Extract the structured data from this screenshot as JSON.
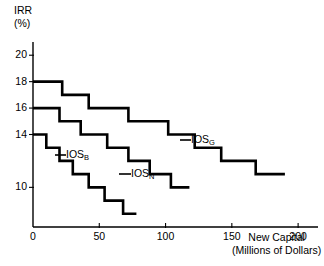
{
  "chart_data": {
    "type": "line",
    "title": "",
    "subtitle": "",
    "xlabel_line1": "New Capital",
    "xlabel_line2": "(Millions of Dollars)",
    "ylabel_line1": "IRR",
    "ylabel_line2": "(%)",
    "xlim": [
      0,
      215
    ],
    "ylim": [
      7,
      21
    ],
    "grid": false,
    "legend_position": "inline-annotations",
    "xticks": [
      0,
      50,
      100,
      150,
      200
    ],
    "xtick_labels": [
      "0",
      "50",
      "100",
      "150",
      "200"
    ],
    "yticks": [
      10,
      14,
      16,
      18,
      20
    ],
    "ytick_labels": [
      "10",
      "14",
      "16",
      "18",
      "20"
    ],
    "line_color": "#000000",
    "series": [
      {
        "name": "IOS_G",
        "label_text": "IOS",
        "label_sub": "G",
        "description": "Good economy investment opportunity schedule",
        "steps": [
          {
            "x_start": 0,
            "x_end": 22,
            "irr": 18
          },
          {
            "x_start": 22,
            "x_end": 42,
            "irr": 17
          },
          {
            "x_start": 42,
            "x_end": 72,
            "irr": 16
          },
          {
            "x_start": 72,
            "x_end": 102,
            "irr": 15
          },
          {
            "x_start": 102,
            "x_end": 122,
            "irr": 14
          },
          {
            "x_start": 122,
            "x_end": 142,
            "irr": 13
          },
          {
            "x_start": 142,
            "x_end": 168,
            "irr": 12
          },
          {
            "x_start": 168,
            "x_end": 190,
            "irr": 11
          }
        ]
      },
      {
        "name": "IOS_N",
        "label_text": "IOS",
        "label_sub": "N",
        "description": "Normal economy investment opportunity schedule",
        "steps": [
          {
            "x_start": 0,
            "x_end": 20,
            "irr": 16
          },
          {
            "x_start": 20,
            "x_end": 36,
            "irr": 15
          },
          {
            "x_start": 36,
            "x_end": 56,
            "irr": 14
          },
          {
            "x_start": 56,
            "x_end": 72,
            "irr": 13
          },
          {
            "x_start": 72,
            "x_end": 88,
            "irr": 12
          },
          {
            "x_start": 88,
            "x_end": 104,
            "irr": 11
          },
          {
            "x_start": 104,
            "x_end": 118,
            "irr": 10
          }
        ]
      },
      {
        "name": "IOS_B",
        "label_text": "IOS",
        "label_sub": "B",
        "description": "Bad economy investment opportunity schedule",
        "steps": [
          {
            "x_start": 0,
            "x_end": 10,
            "irr": 14
          },
          {
            "x_start": 10,
            "x_end": 20,
            "irr": 13
          },
          {
            "x_start": 20,
            "x_end": 30,
            "irr": 12
          },
          {
            "x_start": 30,
            "x_end": 42,
            "irr": 11
          },
          {
            "x_start": 42,
            "x_end": 54,
            "irr": 10
          },
          {
            "x_start": 54,
            "x_end": 68,
            "irr": 9
          },
          {
            "x_start": 68,
            "x_end": 78,
            "irr": 8
          }
        ]
      }
    ]
  }
}
